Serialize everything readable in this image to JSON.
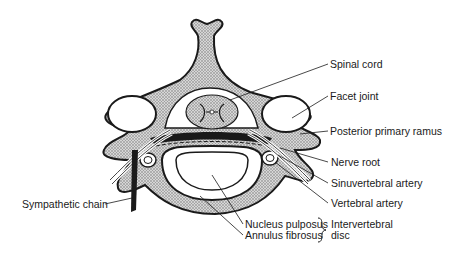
{
  "figure": {
    "colors": {
      "ink": "#1a1a1a",
      "stipple": "#bdbdbd",
      "background": "#ffffff"
    }
  },
  "labels": {
    "spinal_cord": "Spinal cord",
    "facet_joint": "Facet joint",
    "posterior_primary_ramus": "Posterior primary ramus",
    "nerve_root": "Nerve root",
    "sinuvertebral_artery": "Sinuvertebral artery",
    "vertebral_artery": "Vertebral artery",
    "sympathetic_chain": "Sympathetic chain",
    "nucleus_pulposus": "Nucleus pulposus",
    "annulus_fibrosus": "Annulus fibrosus",
    "intervertebral": "Intervertebral",
    "disc": "disc"
  }
}
